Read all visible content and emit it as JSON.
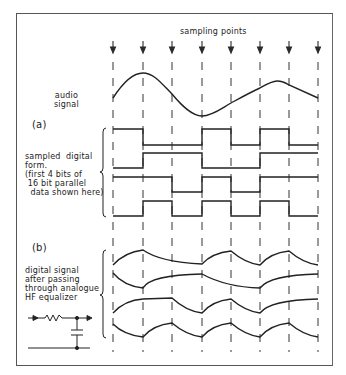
{
  "figure": {
    "title": "sampling points",
    "sampling_points_x": [
      113,
      143,
      172,
      202,
      231,
      260,
      289,
      318
    ],
    "panel_a": {
      "label": "(a)",
      "audio_label": "audio\nsignal",
      "digital_label": "sampled  digital\nform.\n(first 4 bits of\n 16 bit parallel\n  data shown here)",
      "bits": [
        [
          1,
          0,
          0,
          1,
          0,
          1,
          0
        ],
        [
          0,
          1,
          1,
          0,
          0,
          1,
          1
        ],
        [
          1,
          1,
          0,
          1,
          0,
          1,
          1
        ],
        [
          0,
          1,
          0,
          1,
          0,
          1,
          0
        ]
      ]
    },
    "panel_b": {
      "label": "(b)",
      "equalized_label": "digital signal\nafter passing\nthrough analogue\nHF equalizer"
    },
    "colors": {
      "ink": "#2a2a2a",
      "frame": "#555555",
      "background": "#ffffff"
    }
  }
}
